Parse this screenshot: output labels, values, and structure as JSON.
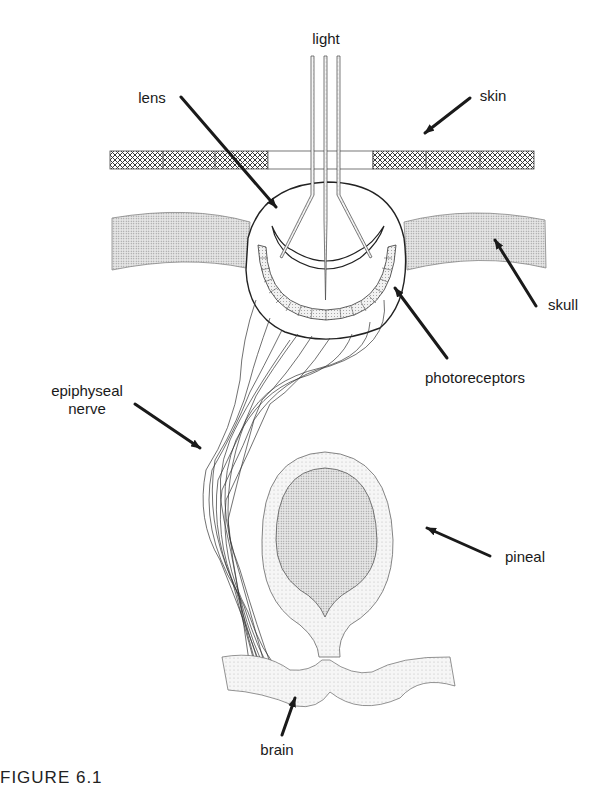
{
  "figure": {
    "type": "anatomical diagram",
    "caption_fragment": "FIGURE 6.1"
  },
  "labels": {
    "light": "light",
    "lens": "lens",
    "skin": "skin",
    "skull": "skull",
    "photoreceptors": "photoreceptors",
    "epiphyseal_line1": "epiphyseal",
    "epiphyseal_line2": "nerve",
    "pineal": "pineal",
    "brain": "brain"
  },
  "colors": {
    "ink": "#1a1a1a",
    "stipple_light": "#e8e8e8",
    "stipple_dark": "#d6d6d6",
    "crosshatch": "#555555",
    "background": "#ffffff"
  }
}
